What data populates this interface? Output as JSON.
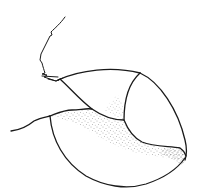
{
  "image": {
    "description": "Pen-and-ink line drawing of a rounded, seed- or shell-like object with segmented lobes, a thin wiry stalk at upper left, and stippled shading along the lower-right region",
    "style": "black ink line art with stipple shading on white background",
    "colors": {
      "background": "#ffffff",
      "ink": "#1a1a1a",
      "stipple": "#555555"
    },
    "elements": [
      {
        "name": "stalk",
        "description": "thin jagged stem rising to the upper left"
      },
      {
        "name": "upper-lobe",
        "description": "small rounded segment at top left of the body"
      },
      {
        "name": "right-lobe",
        "description": "rounded segment on the right side"
      },
      {
        "name": "main-body",
        "description": "large oval lower body"
      },
      {
        "name": "left-tail",
        "description": "wavy line extending to the left"
      },
      {
        "name": "stippling",
        "description": "dotted shading along the inner seams"
      }
    ]
  }
}
